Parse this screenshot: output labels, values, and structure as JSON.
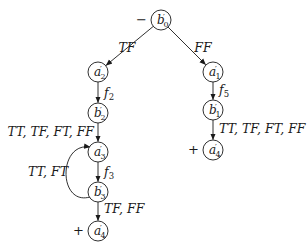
{
  "nodes": [
    {
      "id": "b0",
      "name": "b",
      "sub": "0",
      "prime": true,
      "sign": "−"
    },
    {
      "id": "a2",
      "name": "a",
      "sub": "2",
      "prime": true,
      "sign": ""
    },
    {
      "id": "a1",
      "name": "a",
      "sub": "1",
      "prime": true,
      "sign": ""
    },
    {
      "id": "b2",
      "name": "b",
      "sub": "2",
      "prime": true,
      "sign": ""
    },
    {
      "id": "b1",
      "name": "b",
      "sub": "1",
      "prime": true,
      "sign": ""
    },
    {
      "id": "a3",
      "name": "a",
      "sub": "3",
      "prime": true,
      "sign": ""
    },
    {
      "id": "a4r",
      "name": "a",
      "sub": "4",
      "prime": true,
      "sign": "+"
    },
    {
      "id": "b3",
      "name": "b",
      "sub": "3",
      "prime": true,
      "sign": ""
    },
    {
      "id": "a4l",
      "name": "a",
      "sub": "4",
      "prime": true,
      "sign": "+"
    }
  ],
  "edges": [
    {
      "from": "b0",
      "to": "a2",
      "label": "TF"
    },
    {
      "from": "b0",
      "to": "a1",
      "label": "FF"
    },
    {
      "from": "a2",
      "to": "b2",
      "label": "f2"
    },
    {
      "from": "a1",
      "to": "b1",
      "label": "f5"
    },
    {
      "from": "b2",
      "to": "a3",
      "label": "TT, TF, FT, FF"
    },
    {
      "from": "b1",
      "to": "a4r",
      "label": "TT, TF, FT, FF"
    },
    {
      "from": "a3",
      "to": "b3",
      "label": "f3"
    },
    {
      "from": "b3",
      "to": "a3",
      "label": "TT, FT",
      "curved": true
    },
    {
      "from": "b3",
      "to": "a4l",
      "label": "TF, FF"
    }
  ]
}
